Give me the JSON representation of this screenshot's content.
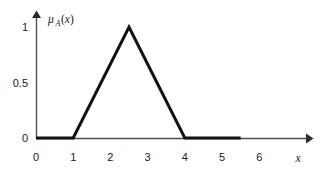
{
  "chart_data": {
    "type": "line",
    "title": "",
    "subtitle": "",
    "xlabel": "x",
    "ylabel": "μ_A(x)",
    "ylabel_parts": {
      "mu": "μ",
      "subscript": "A",
      "argument": "(x)"
    },
    "x": [
      0,
      1,
      2.5,
      4,
      5.5
    ],
    "values": [
      0,
      0,
      1,
      0,
      0
    ],
    "series": [
      {
        "name": "μ_A(x)",
        "points": [
          {
            "x": 0,
            "y": 0
          },
          {
            "x": 1,
            "y": 0
          },
          {
            "x": 2.5,
            "y": 1
          },
          {
            "x": 4,
            "y": 0
          },
          {
            "x": 5.5,
            "y": 0
          }
        ]
      }
    ],
    "xlim": [
      0,
      6.6
    ],
    "ylim": [
      0,
      1.12
    ],
    "xticks": [
      0,
      1,
      2,
      3,
      4,
      5,
      6
    ],
    "xtick_labels": [
      "0",
      "1",
      "2",
      "3",
      "4",
      "5",
      "6"
    ],
    "yticks": [
      0,
      0.5,
      1
    ],
    "ytick_labels": [
      "0",
      "0.5",
      "1"
    ],
    "grid": false,
    "legend": null,
    "legend_position": "none",
    "annotations": [],
    "line_color": "#111111",
    "axis_color": "#4d4d4d",
    "background_color": "#ffffff",
    "axis_arrows": {
      "x": true,
      "y": true
    }
  }
}
